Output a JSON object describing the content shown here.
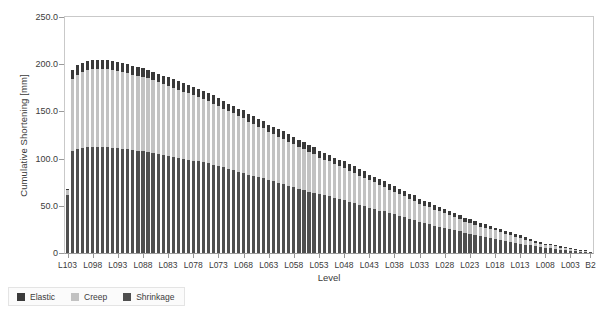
{
  "chart_data": {
    "type": "bar",
    "subtype": "stacked-vertical",
    "title": "",
    "xlabel": "Level",
    "ylabel": "Cumulative Shortening [mm]",
    "ylim": [
      0,
      250
    ],
    "yticks": [
      "0",
      "50.0",
      "100.0",
      "150.0",
      "200.0",
      "250.0"
    ],
    "ytick_values": [
      0,
      50,
      100,
      150,
      200,
      250
    ],
    "grid": false,
    "legend_position": "below-left",
    "stack_order_bottom_to_top": [
      "Shrinkage",
      "Creep",
      "Elastic"
    ],
    "colors": {
      "Elastic": "#3a3a3a",
      "Creep": "#c2c2c2",
      "Shrinkage": "#4f4f4f"
    },
    "categories": [
      "L103",
      "L102",
      "L101",
      "L100",
      "L099",
      "L098",
      "L097",
      "L096",
      "L095",
      "L094",
      "L093",
      "L092",
      "L091",
      "L090",
      "L089",
      "L088",
      "L087",
      "L086",
      "L085",
      "L084",
      "L083",
      "L082",
      "L081",
      "L080",
      "L079",
      "L078",
      "L077",
      "L076",
      "L075",
      "L074",
      "L073",
      "L072",
      "L071",
      "L070",
      "L069",
      "L068",
      "L067",
      "L066",
      "L065",
      "L064",
      "L063",
      "L062",
      "L061",
      "L060",
      "L059",
      "L058",
      "L057",
      "L056",
      "L055",
      "L054",
      "L053",
      "L052",
      "L051",
      "L050",
      "L049",
      "L048",
      "L047",
      "L046",
      "L045",
      "L044",
      "L043",
      "L042",
      "L041",
      "L040",
      "L039",
      "L038",
      "L037",
      "L036",
      "L035",
      "L034",
      "L033",
      "L032",
      "L031",
      "L030",
      "L029",
      "L028",
      "L027",
      "L026",
      "L025",
      "L024",
      "L023",
      "L022",
      "L021",
      "L020",
      "L019",
      "L018",
      "L017",
      "L016",
      "L015",
      "L014",
      "L013",
      "L012",
      "L011",
      "L010",
      "L009",
      "L008",
      "L007",
      "L006",
      "L005",
      "L004",
      "L003",
      "L002",
      "L001",
      "B1",
      "B2"
    ],
    "xtick_labels_shown": [
      "L103",
      "L098",
      "L093",
      "L088",
      "L083",
      "L078",
      "L073",
      "L068",
      "L063",
      "L058",
      "L053",
      "L048",
      "L043",
      "L038",
      "L033",
      "L028",
      "L023",
      "L018",
      "L013",
      "L008",
      "L003",
      "B2"
    ],
    "series": [
      {
        "name": "Shrinkage",
        "values": [
          61,
          108,
          110,
          111,
          112,
          112,
          112,
          112,
          112,
          111,
          111,
          110,
          110,
          109,
          108,
          108,
          107,
          106,
          105,
          104,
          103,
          102,
          101,
          100,
          99,
          98,
          97,
          96,
          95,
          93,
          92,
          91,
          89,
          88,
          86,
          85,
          83,
          82,
          80,
          79,
          77,
          76,
          74,
          73,
          71,
          70,
          68,
          67,
          65,
          64,
          62,
          61,
          60,
          58,
          57,
          56,
          54,
          53,
          51,
          50,
          48,
          47,
          45,
          44,
          42,
          41,
          39,
          38,
          36,
          35,
          33,
          32,
          31,
          29,
          28,
          27,
          25,
          24,
          23,
          21,
          20,
          19,
          18,
          17,
          16,
          15,
          14,
          13,
          12,
          11,
          10,
          9,
          8,
          7,
          6,
          5,
          5,
          4,
          3,
          3,
          2,
          2,
          1,
          1,
          1
        ]
      },
      {
        "name": "Creep",
        "values": [
          6,
          76,
          79,
          81,
          82,
          83,
          83,
          83,
          83,
          83,
          82,
          82,
          81,
          80,
          80,
          79,
          78,
          77,
          76,
          75,
          74,
          73,
          72,
          71,
          70,
          69,
          68,
          67,
          66,
          65,
          64,
          62,
          61,
          60,
          59,
          58,
          56,
          55,
          54,
          53,
          51,
          50,
          49,
          48,
          47,
          45,
          44,
          43,
          42,
          41,
          39,
          38,
          37,
          36,
          35,
          34,
          33,
          32,
          31,
          30,
          29,
          28,
          27,
          26,
          25,
          24,
          23,
          22,
          21,
          20,
          19,
          18,
          18,
          17,
          16,
          15,
          15,
          14,
          13,
          12,
          12,
          11,
          10,
          10,
          9,
          9,
          8,
          7,
          7,
          6,
          6,
          5,
          5,
          4,
          4,
          3,
          3,
          3,
          2,
          2,
          2,
          1,
          1,
          1,
          0
        ]
      },
      {
        "name": "Elastic",
        "values": [
          1,
          10,
          10,
          9,
          9,
          9,
          9,
          9,
          9,
          9,
          9,
          9,
          9,
          9,
          9,
          9,
          9,
          9,
          9,
          9,
          9,
          9,
          9,
          9,
          9,
          9,
          9,
          9,
          9,
          9,
          8,
          8,
          8,
          8,
          8,
          8,
          8,
          8,
          8,
          8,
          8,
          8,
          8,
          8,
          8,
          8,
          8,
          8,
          7,
          7,
          7,
          7,
          7,
          7,
          7,
          7,
          7,
          7,
          7,
          7,
          6,
          6,
          6,
          6,
          6,
          6,
          6,
          6,
          6,
          6,
          5,
          5,
          5,
          5,
          5,
          5,
          5,
          4,
          4,
          4,
          4,
          4,
          4,
          4,
          4,
          3,
          3,
          3,
          3,
          3,
          3,
          3,
          2,
          2,
          2,
          2,
          2,
          2,
          2,
          1,
          1,
          1,
          1,
          1,
          0
        ]
      }
    ]
  },
  "legend": {
    "items": [
      {
        "label": "Elastic",
        "color": "#3a3a3a"
      },
      {
        "label": "Creep",
        "color": "#c2c2c2"
      },
      {
        "label": "Shrinkage",
        "color": "#4f4f4f"
      }
    ]
  }
}
